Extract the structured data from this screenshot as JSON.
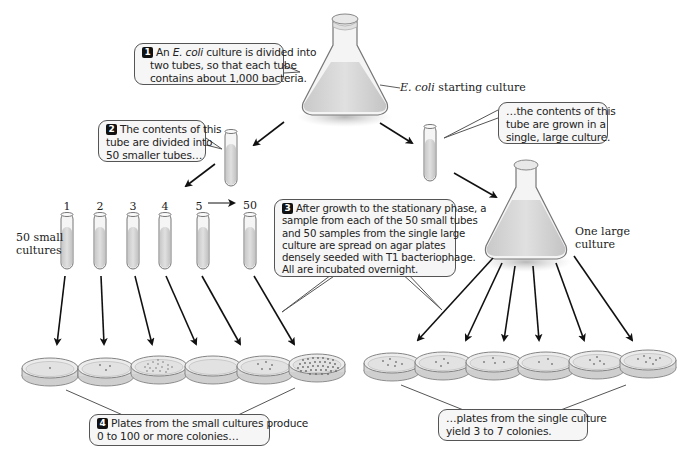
{
  "steps": {
    "step1": {
      "number": "1",
      "text_before": "An ",
      "italic": "E. coli",
      "text_after": " culture is divided into",
      "line2": "two tubes, so that each tube",
      "line3": "contains about 1,000 bacteria."
    },
    "step2": {
      "number": "2",
      "line1": "The contents of this",
      "line2": "tube are divided into",
      "line3": "50 smaller tubes…"
    },
    "step2b": {
      "line1": "…the contents of this",
      "line2": "tube are grown in a",
      "line3": "single, large culture."
    },
    "step3": {
      "number": "3",
      "line1": "After growth to the stationary phase, a",
      "line2": "sample from each of the 50 small tubes",
      "line3": "and 50 samples from the single large",
      "line4": "culture are spread on agar plates",
      "line5": "densely seeded with T1 bacteriophage.",
      "line6": "All are incubated overnight."
    },
    "step4": {
      "number": "4",
      "line1": "Plates from the small cultures produce",
      "line2": "0 to 100 or more colonies…"
    },
    "step4b": {
      "line1": "…plates from the single culture",
      "line2": "yield 3 to 7 colonies."
    }
  },
  "labels": {
    "starting_culture_italic": "E. coli",
    "starting_culture_rest": " starting culture",
    "small_cultures_line1": "50 small",
    "small_cultures_line2": "cultures",
    "large_culture_line1": "One large",
    "large_culture_line2": "culture"
  },
  "tube_numbers": [
    "1",
    "2",
    "3",
    "4",
    "5",
    "50"
  ],
  "colors": {
    "liquid": "#d6d6d6",
    "glass": "#f4f4f4",
    "outline": "#666666",
    "arrow": "#111111",
    "callout_bg": "#f6f6f6"
  },
  "plates": {
    "small_culture_colony_counts": [
      1,
      3,
      20,
      0,
      5,
      60
    ],
    "large_culture_colony_counts": [
      6,
      4,
      4,
      3,
      5,
      7
    ]
  }
}
